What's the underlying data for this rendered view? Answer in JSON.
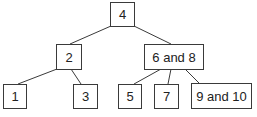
{
  "diagram": {
    "type": "tree",
    "colors": {
      "line": "#3a3a3a",
      "text": "#222222",
      "background": "#ffffff"
    },
    "nodes": {
      "root": {
        "label": "4"
      },
      "left": {
        "label": "2"
      },
      "right": {
        "label": "6 and 8"
      },
      "ll": {
        "label": "1"
      },
      "lr": {
        "label": "3"
      },
      "rl": {
        "label": "5"
      },
      "rm": {
        "label": "7"
      },
      "rr": {
        "label": "9 and 10"
      }
    },
    "edges": [
      [
        "4",
        "2"
      ],
      [
        "4",
        "6 and 8"
      ],
      [
        "2",
        "1"
      ],
      [
        "2",
        "3"
      ],
      [
        "6 and 8",
        "5"
      ],
      [
        "6 and 8",
        "7"
      ],
      [
        "6 and 8",
        "9 and 10"
      ]
    ]
  }
}
